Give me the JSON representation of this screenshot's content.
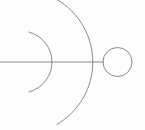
{
  "figure": {
    "canvas": {
      "width": 145,
      "height": 130,
      "background_color": "#fefefe"
    },
    "stroke": {
      "color": "#8a8a8a",
      "width": 1,
      "fill": "none",
      "linecap": "round"
    },
    "watermark": {
      "text": "",
      "color": "#8c8278",
      "opacity": 0.1
    }
  },
  "chart_data": {
    "type": "line",
    "xlabel": "",
    "ylabel": "",
    "xlim": [
      0,
      145
    ],
    "ylim": [
      0,
      130
    ],
    "grid": false,
    "legend": "none",
    "shapes": [
      {
        "name": "axis-line",
        "kind": "line",
        "x1": 0,
        "y1": 62,
        "x2": 104,
        "y2": 62,
        "color": "#8a8a8a",
        "width": 1
      },
      {
        "name": "node-circle",
        "kind": "circle",
        "cx": 117.5,
        "cy": 62,
        "r": 14.5,
        "color": "#8a8a8a",
        "width": 1,
        "fill": "none"
      },
      {
        "name": "inner-arc",
        "kind": "arc",
        "cx": 21,
        "cy": 62,
        "r": 31,
        "start_angle_deg": -75,
        "end_angle_deg": 75,
        "opens": "left",
        "color": "#8a8a8a",
        "width": 1
      },
      {
        "name": "outer-arc",
        "kind": "arc",
        "cx": 21,
        "cy": 62,
        "r": 72,
        "start_angle_deg": -60,
        "end_angle_deg": 60,
        "opens": "left",
        "color": "#8a8a8a",
        "width": 1
      }
    ]
  }
}
